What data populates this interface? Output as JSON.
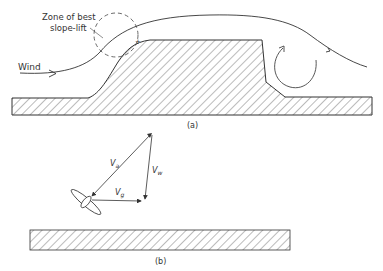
{
  "figure": {
    "panel_a": {
      "caption": "(a)",
      "zone_label_line1": "Zone of best",
      "zone_label_line2": "slope-lift",
      "wind_label": "Wind"
    },
    "panel_b": {
      "caption": "(b)",
      "vectors": [
        {
          "name": "Va",
          "symbol": "V",
          "subscript": "a"
        },
        {
          "name": "Vw",
          "symbol": "V",
          "subscript": "w"
        },
        {
          "name": "Vg",
          "symbol": "V",
          "subscript": "g"
        }
      ]
    },
    "colors": {
      "ink": "#333333",
      "background": "#ffffff"
    }
  }
}
